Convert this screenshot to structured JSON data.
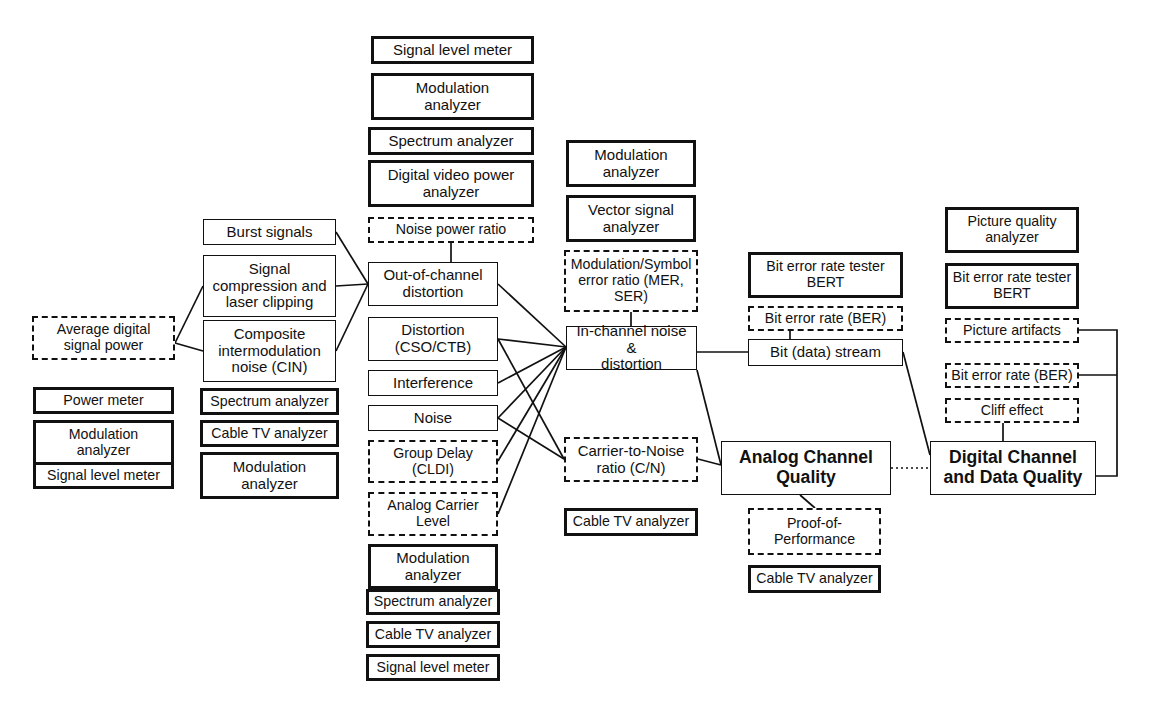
{
  "diagram": {
    "colors": {
      "line": "#111111",
      "background": "#ffffff"
    },
    "nodes": [
      {
        "id": "n01",
        "label": "Signal level meter",
        "style": "thick",
        "x": 371,
        "y": 36,
        "w": 163,
        "h": 28,
        "font": "f15"
      },
      {
        "id": "n02",
        "label": "Modulation\nanalyzer",
        "style": "thick",
        "x": 371,
        "y": 73,
        "w": 163,
        "h": 47,
        "font": "f15"
      },
      {
        "id": "n03",
        "label": "Spectrum analyzer",
        "style": "thick",
        "x": 368,
        "y": 127,
        "w": 166,
        "h": 28,
        "font": "f15"
      },
      {
        "id": "n04",
        "label": "Digital video power\nanalyzer",
        "style": "thick",
        "x": 368,
        "y": 160,
        "w": 166,
        "h": 47,
        "font": "f15"
      },
      {
        "id": "n05",
        "label": "Noise power ratio",
        "style": "dashed",
        "x": 368,
        "y": 217,
        "w": 166,
        "h": 26,
        "font": "f14"
      },
      {
        "id": "n06",
        "label": "Out-of-channel\ndistortion",
        "style": "thin",
        "x": 368,
        "y": 262,
        "w": 130,
        "h": 44,
        "font": "f15"
      },
      {
        "id": "n07",
        "label": "Distortion\n(CSO/CTB)",
        "style": "thin",
        "x": 368,
        "y": 317,
        "w": 130,
        "h": 44,
        "font": "f15"
      },
      {
        "id": "n08",
        "label": "Interference",
        "style": "thin",
        "x": 368,
        "y": 370,
        "w": 130,
        "h": 26,
        "font": "f15"
      },
      {
        "id": "n09",
        "label": "Noise",
        "style": "thin",
        "x": 368,
        "y": 405,
        "w": 130,
        "h": 26,
        "font": "f15"
      },
      {
        "id": "n10",
        "label": "Group Delay\n(CLDI)",
        "style": "dashed",
        "x": 368,
        "y": 440,
        "w": 130,
        "h": 43,
        "font": "f14"
      },
      {
        "id": "n11",
        "label": "Analog Carrier\nLevel",
        "style": "dashed",
        "x": 368,
        "y": 492,
        "w": 130,
        "h": 44,
        "font": "f14"
      },
      {
        "id": "n12",
        "label": "Modulation\nanalyzer",
        "style": "thick",
        "x": 368,
        "y": 544,
        "w": 130,
        "h": 45,
        "font": "f15"
      },
      {
        "id": "n13",
        "label": "Spectrum analyzer",
        "style": "thick",
        "x": 366,
        "y": 589,
        "w": 134,
        "h": 26,
        "font": "f14"
      },
      {
        "id": "n14",
        "label": "Cable TV analyzer",
        "style": "thick",
        "x": 366,
        "y": 621,
        "w": 134,
        "h": 27,
        "font": "f14"
      },
      {
        "id": "n15",
        "label": "Signal level meter",
        "style": "thick",
        "x": 366,
        "y": 654,
        "w": 134,
        "h": 27,
        "font": "f14"
      },
      {
        "id": "n16",
        "label": "Burst signals",
        "style": "thin",
        "x": 203,
        "y": 219,
        "w": 133,
        "h": 26,
        "font": "f15"
      },
      {
        "id": "n17",
        "label": "Signal\ncompression and\nlaser clipping",
        "style": "thin",
        "x": 203,
        "y": 255,
        "w": 133,
        "h": 62,
        "font": "f15"
      },
      {
        "id": "n18",
        "label": "Composite\nintermodulation\nnoise (CIN)",
        "style": "thin",
        "x": 203,
        "y": 320,
        "w": 133,
        "h": 62,
        "font": "f15"
      },
      {
        "id": "n19",
        "label": "Spectrum analyzer",
        "style": "thick",
        "x": 200,
        "y": 388,
        "w": 139,
        "h": 27,
        "font": "f14"
      },
      {
        "id": "n20",
        "label": "Cable TV analyzer",
        "style": "thick",
        "x": 200,
        "y": 420,
        "w": 139,
        "h": 27,
        "font": "f14"
      },
      {
        "id": "n21",
        "label": "Modulation\nanalyzer",
        "style": "thick",
        "x": 200,
        "y": 452,
        "w": 139,
        "h": 47,
        "font": "f15"
      },
      {
        "id": "n22",
        "label": "Average digital\nsignal power",
        "style": "dashed",
        "x": 32,
        "y": 316,
        "w": 143,
        "h": 44,
        "font": "f14"
      },
      {
        "id": "n23",
        "label": "Power meter",
        "style": "thick",
        "x": 33,
        "y": 387,
        "w": 141,
        "h": 27,
        "font": "f14"
      },
      {
        "id": "n24",
        "label": "Modulation\nanalyzer",
        "style": "thick",
        "x": 33,
        "y": 420,
        "w": 141,
        "h": 46,
        "font": "f14"
      },
      {
        "id": "n25",
        "label": "Signal level meter",
        "style": "thick",
        "x": 33,
        "y": 462,
        "w": 141,
        "h": 27,
        "font": "f14"
      },
      {
        "id": "n26",
        "label": "Modulation\nanalyzer",
        "style": "thick",
        "x": 566,
        "y": 140,
        "w": 130,
        "h": 47,
        "font": "f15"
      },
      {
        "id": "n27",
        "label": "Vector signal\nanalyzer",
        "style": "thick",
        "x": 566,
        "y": 195,
        "w": 130,
        "h": 47,
        "font": "f15"
      },
      {
        "id": "n28",
        "label": "Modulation/Symbol\nerror ratio (MER,\nSER)",
        "style": "dashed",
        "x": 564,
        "y": 250,
        "w": 134,
        "h": 62,
        "font": "f14"
      },
      {
        "id": "n29",
        "label": "In-channel noise &\ndistortion",
        "style": "thin",
        "x": 566,
        "y": 326,
        "w": 131,
        "h": 44,
        "font": "f15"
      },
      {
        "id": "n30",
        "label": "Carrier-to-Noise\nratio (C/N)",
        "style": "dashed",
        "x": 564,
        "y": 437,
        "w": 134,
        "h": 45,
        "font": "f15"
      },
      {
        "id": "n31",
        "label": "Cable TV analyzer",
        "style": "thick",
        "x": 564,
        "y": 508,
        "w": 134,
        "h": 28,
        "font": "f14"
      },
      {
        "id": "n32",
        "label": "Bit error rate tester\nBERT",
        "style": "thick",
        "x": 748,
        "y": 252,
        "w": 155,
        "h": 46,
        "font": "f14"
      },
      {
        "id": "n33",
        "label": "Bit error rate (BER)",
        "style": "dashed",
        "x": 748,
        "y": 306,
        "w": 155,
        "h": 25,
        "font": "f14"
      },
      {
        "id": "n34",
        "label": "Bit (data) stream",
        "style": "thin",
        "x": 748,
        "y": 339,
        "w": 155,
        "h": 27,
        "font": "f15"
      },
      {
        "id": "n35",
        "label": "Analog Channel\nQuality",
        "style": "thin",
        "x": 721,
        "y": 441,
        "w": 170,
        "h": 54,
        "font": "f17",
        "bold": true
      },
      {
        "id": "n36",
        "label": "Proof-of-\nPerformance",
        "style": "dashed",
        "x": 748,
        "y": 508,
        "w": 133,
        "h": 47,
        "font": "f14"
      },
      {
        "id": "n37",
        "label": "Cable TV analyzer",
        "style": "thick",
        "x": 748,
        "y": 565,
        "w": 133,
        "h": 28,
        "font": "f14"
      },
      {
        "id": "n38",
        "label": "Picture quality\nanalyzer",
        "style": "thick",
        "x": 945,
        "y": 207,
        "w": 134,
        "h": 46,
        "font": "f14"
      },
      {
        "id": "n39",
        "label": "Bit error rate tester\nBERT",
        "style": "thick",
        "x": 945,
        "y": 263,
        "w": 134,
        "h": 46,
        "font": "f14"
      },
      {
        "id": "n40",
        "label": "Picture artifacts",
        "style": "dashed",
        "x": 945,
        "y": 318,
        "w": 134,
        "h": 25,
        "font": "f14"
      },
      {
        "id": "n41",
        "label": "Bit error rate (BER)",
        "style": "dashed",
        "x": 945,
        "y": 363,
        "w": 134,
        "h": 25,
        "font": "f14"
      },
      {
        "id": "n42",
        "label": "Cliff effect",
        "style": "dashed",
        "x": 945,
        "y": 398,
        "w": 134,
        "h": 25,
        "font": "f14"
      },
      {
        "id": "n43",
        "label": "Digital Channel\nand Data Quality",
        "style": "thin",
        "x": 930,
        "y": 441,
        "w": 166,
        "h": 54,
        "font": "f17",
        "bold": true
      }
    ],
    "edges": [
      {
        "id": "e01",
        "from": "n05",
        "to": "n06",
        "kind": "solid",
        "points": "451,243 451,262"
      },
      {
        "id": "e02",
        "from": "n16",
        "to": "n06",
        "kind": "solid",
        "points": "336,232 368,284"
      },
      {
        "id": "e03",
        "from": "n17",
        "to": "n06",
        "kind": "solid",
        "points": "336,286 368,284"
      },
      {
        "id": "e04",
        "from": "n18",
        "to": "n06",
        "kind": "solid",
        "points": "336,351 368,284"
      },
      {
        "id": "e05",
        "from": "n22",
        "to": "n17",
        "kind": "solid",
        "points": "175,343 203,286"
      },
      {
        "id": "e06",
        "from": "n22",
        "to": "n18",
        "kind": "solid",
        "points": "175,343 203,351"
      },
      {
        "id": "e07",
        "from": "n06",
        "to": "n29",
        "kind": "solid",
        "points": "498,284 566,347"
      },
      {
        "id": "e08",
        "from": "n07",
        "to": "n29",
        "kind": "solid",
        "points": "498,339 566,347"
      },
      {
        "id": "e09",
        "from": "n08",
        "to": "n29",
        "kind": "solid",
        "points": "498,383 566,347"
      },
      {
        "id": "e10",
        "from": "n09",
        "to": "n29",
        "kind": "solid",
        "points": "498,418 566,347"
      },
      {
        "id": "e11",
        "from": "n10",
        "to": "n29",
        "kind": "solid",
        "points": "498,461 566,347"
      },
      {
        "id": "e12",
        "from": "n11",
        "to": "n29",
        "kind": "solid",
        "points": "498,514 566,347"
      },
      {
        "id": "e13",
        "from": "n28",
        "to": "n29",
        "kind": "solid",
        "points": "631,312 631,326"
      },
      {
        "id": "e14",
        "from": "n07",
        "to": "n30",
        "kind": "solid",
        "points": "498,339 564,459"
      },
      {
        "id": "e15",
        "from": "n09",
        "to": "n30",
        "kind": "solid",
        "points": "498,418 564,459"
      },
      {
        "id": "e16",
        "from": "n29",
        "to": "n35",
        "kind": "solid",
        "points": "697,370 721,465"
      },
      {
        "id": "e17",
        "from": "n30",
        "to": "n35",
        "kind": "solid",
        "points": "698,459 721,465"
      },
      {
        "id": "e18",
        "from": "n29",
        "to": "n34",
        "kind": "solid",
        "points": "697,352 748,352"
      },
      {
        "id": "e19",
        "from": "n33",
        "to": "n34",
        "kind": "solid",
        "points": "790,331 790,339"
      },
      {
        "id": "e20",
        "from": "n34",
        "to": "n43",
        "kind": "solid",
        "points": "903,352 930,455"
      },
      {
        "id": "e21",
        "from": "n35",
        "to": "n43",
        "kind": "dotted",
        "points": "891,468 930,468"
      },
      {
        "id": "e22",
        "from": "n35",
        "to": "n36",
        "kind": "solid",
        "points": "800,495 815,508"
      },
      {
        "id": "e23",
        "from": "n42",
        "to": "n43",
        "kind": "solid",
        "points": "1003,423 1003,441"
      },
      {
        "id": "e24",
        "from": "n40",
        "to": "n43",
        "kind": "solid",
        "points": "1079,330 1117,330 1117,476 1096,476"
      },
      {
        "id": "e25",
        "from": "n41",
        "to": "n43",
        "kind": "solid",
        "points": "1079,375 1117,375"
      }
    ]
  }
}
